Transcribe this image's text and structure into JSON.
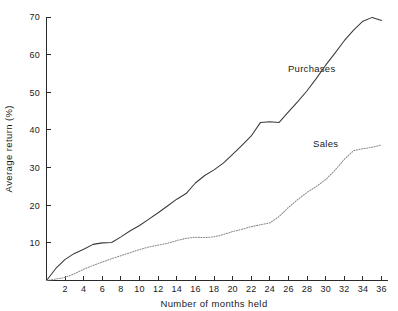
{
  "chart_data": {
    "type": "line",
    "title": "",
    "xlabel": "Number of months held",
    "ylabel": "Average return (%)",
    "xlim": [
      0,
      36
    ],
    "ylim": [
      0,
      70
    ],
    "grid": false,
    "legend_position": "inline-annotation",
    "xticks": [
      2,
      4,
      6,
      8,
      10,
      12,
      14,
      16,
      18,
      20,
      22,
      24,
      26,
      28,
      30,
      32,
      34,
      36
    ],
    "xtick_labels": [
      "2",
      "4",
      "6",
      "8",
      "10",
      "12",
      "14",
      "16",
      "18",
      "20",
      "22",
      "24",
      "26",
      "28",
      "30",
      "32",
      "34",
      "36"
    ],
    "yticks": [
      10,
      20,
      30,
      40,
      50,
      60,
      70
    ],
    "ytick_labels": [
      "10",
      "20",
      "30",
      "40",
      "50",
      "60",
      "70"
    ],
    "x": [
      0,
      1,
      2,
      3,
      4,
      5,
      6,
      7,
      8,
      9,
      10,
      11,
      12,
      13,
      14,
      15,
      16,
      17,
      18,
      19,
      20,
      21,
      22,
      23,
      24,
      25,
      26,
      27,
      28,
      29,
      30,
      31,
      32,
      33,
      34,
      35,
      36
    ],
    "series": [
      {
        "name": "Purchases",
        "style": "solid",
        "color": "#3a3a3a",
        "label_x": 28.5,
        "label_y": 55.5,
        "values": [
          0,
          3.2,
          5.6,
          7.2,
          8.3,
          9.6,
          10.0,
          10.1,
          11.6,
          13.2,
          14.6,
          16.3,
          18.0,
          19.8,
          21.6,
          23.1,
          25.9,
          27.9,
          29.4,
          31.2,
          33.5,
          35.9,
          38.4,
          42.0,
          42.2,
          42.0,
          44.8,
          47.5,
          50.4,
          53.7,
          57.2,
          60.4,
          63.7,
          66.5,
          68.9,
          69.9,
          69.1
        ]
      },
      {
        "name": "Sales",
        "style": "dotted",
        "color": "#8a8a8a",
        "label_x": 30.0,
        "label_y": 35.5,
        "values": [
          0,
          0.4,
          0.8,
          1.8,
          3.0,
          4.0,
          4.9,
          5.8,
          6.6,
          7.4,
          8.2,
          8.9,
          9.4,
          9.9,
          10.6,
          11.2,
          11.5,
          11.4,
          11.6,
          12.2,
          13.0,
          13.6,
          14.3,
          14.8,
          15.3,
          17.0,
          19.4,
          21.5,
          23.4,
          25.0,
          26.8,
          29.3,
          32.2,
          34.5,
          35.0,
          35.4,
          36.0
        ]
      }
    ],
    "annotations": [
      {
        "text": "Purchases",
        "x": 28.5,
        "y": 55.5
      },
      {
        "text": "Sales",
        "x": 30.0,
        "y": 35.5
      }
    ]
  }
}
